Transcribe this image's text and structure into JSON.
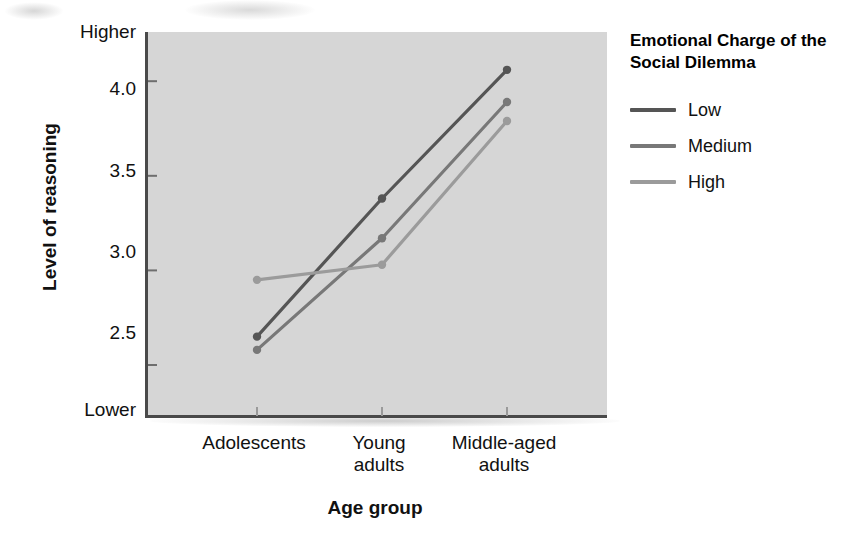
{
  "chart_data": {
    "type": "line",
    "title": "",
    "xlabel": "Age group",
    "ylabel": "Level of reasoning",
    "categories": [
      "Adolescents",
      "Young adults",
      "Middle-aged adults"
    ],
    "category_labels_wrapped": [
      [
        "Adolescents"
      ],
      [
        "Young",
        "adults"
      ],
      [
        "Middle-aged",
        "adults"
      ]
    ],
    "series": [
      {
        "name": "Low",
        "values": [
          2.65,
          3.38,
          4.06
        ],
        "color": "#555555"
      },
      {
        "name": "Medium",
        "values": [
          2.58,
          3.17,
          3.89
        ],
        "color": "#787878"
      },
      {
        "name": "High",
        "values": [
          2.95,
          3.03,
          3.79
        ],
        "color": "#9b9b9b"
      }
    ],
    "ytick_labels": [
      "4.0",
      "3.5",
      "3.0",
      "2.5"
    ],
    "ytick_values": [
      4.0,
      3.5,
      3.0,
      2.5
    ],
    "y_axis_endpoint_high": "Higher",
    "y_axis_endpoint_low": "Lower",
    "ylim": [
      2.22,
      4.26
    ],
    "grid": false,
    "legend_position": "right",
    "plot_background": "#d6d6d6",
    "marker": "circle"
  },
  "axes": {
    "y_title": "Level of reasoning",
    "x_title": "Age group",
    "y_labels": [
      {
        "text": "Higher",
        "top": 22
      },
      {
        "text": "4.0",
        "top": 79
      },
      {
        "text": "3.5",
        "top": 161
      },
      {
        "text": "3.0",
        "top": 242
      },
      {
        "text": "2.5",
        "top": 323
      },
      {
        "text": "Lower",
        "top": 400
      }
    ],
    "x_labels": [
      {
        "line1": "Adolescents",
        "line2": "",
        "center": 254
      },
      {
        "line1": "Young",
        "line2": "adults",
        "center": 379
      },
      {
        "line1": "Middle-aged",
        "line2": "adults",
        "center": 504
      }
    ]
  },
  "legend": {
    "title": "Emotional Charge of the Social Dilemma",
    "items": [
      {
        "label": "Low",
        "color": "#555555"
      },
      {
        "label": "Medium",
        "color": "#787878"
      },
      {
        "label": "High",
        "color": "#9b9b9b"
      }
    ]
  }
}
